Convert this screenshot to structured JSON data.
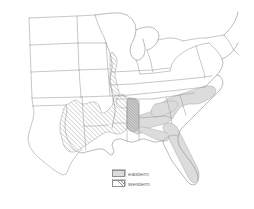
{
  "figure": {
    "type": "distribution-map",
    "region": "Southeastern and Central United States",
    "background_color": "#ffffff",
    "outline_color": "#9a9a9a"
  },
  "legend": {
    "position": "bottom-center",
    "items": [
      {
        "key": "eastern",
        "label": "eastern",
        "pattern": "solid-fill",
        "color": "#dcdcdc",
        "border_color": "#8f8f8f"
      },
      {
        "key": "western",
        "label": "western",
        "pattern": "diagonal-hatch",
        "color": "#8f8f8f",
        "border_color": "#8f8f8f"
      }
    ]
  },
  "ranges": {
    "eastern": {
      "label": "eastern",
      "fill": "#dcdcdc",
      "description": "Atlantic and Gulf coastal plain",
      "states_covered": [
        "Florida",
        "Georgia",
        "South Carolina",
        "North Carolina",
        "Alabama",
        "Mississippi",
        "Virginia"
      ]
    },
    "western": {
      "label": "western",
      "fill": "diagonal-hatch",
      "description": "Lower Mississippi valley and east Texas",
      "states_covered": [
        "Texas",
        "Louisiana",
        "Arkansas",
        "Mississippi",
        "Alabama",
        "Tennessee",
        "Missouri"
      ]
    },
    "overlap": {
      "label": "overlap",
      "description": "western Alabama contact zone"
    }
  }
}
